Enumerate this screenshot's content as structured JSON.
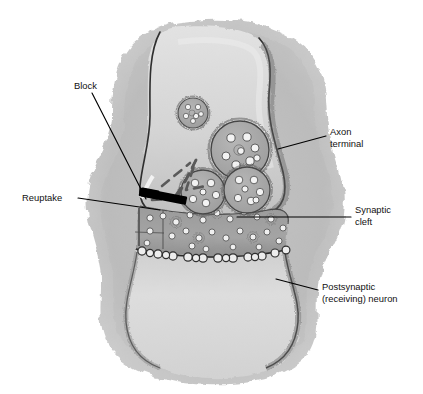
{
  "figure": {
    "type": "biological-illustration",
    "background_color": "#ffffff"
  },
  "colors": {
    "outer_cell_halo": "#b9b9b9",
    "cell_body_light": "#dedede",
    "axon_terminal_fill": "#cfcfcf",
    "synaptic_cleft_fill": "#9e9e9e",
    "postsynaptic_fill": "#d6d6d6",
    "vesicle_fill": "#a8a8a8",
    "vesicle_dot": "#f2f2f2",
    "membrane_outline": "#2b2b2b",
    "block_bar": "#000000",
    "dashed_path": "#5a5a5a",
    "leader_line": "#000000",
    "label_text": "#111111"
  },
  "labels": [
    {
      "id": "block",
      "lines": [
        "Block"
      ],
      "text_x": 74,
      "text_y": 89,
      "anchor": "start",
      "leader": {
        "x1": 92,
        "y1": 93,
        "x2": 146,
        "y2": 199
      }
    },
    {
      "id": "reuptake",
      "lines": [
        "Reuptake"
      ],
      "text_x": 22,
      "text_y": 201,
      "anchor": "start",
      "leader": {
        "x1": 78,
        "y1": 198,
        "x2": 160,
        "y2": 210
      }
    },
    {
      "id": "axon-terminal",
      "lines": [
        "Axon",
        "terminal"
      ],
      "text_x": 330,
      "text_y": 135,
      "anchor": "start",
      "leader": {
        "x1": 278,
        "y1": 149,
        "x2": 326,
        "y2": 136
      }
    },
    {
      "id": "synaptic-cleft",
      "lines": [
        "Synaptic",
        "cleft"
      ],
      "text_x": 355,
      "text_y": 213,
      "anchor": "start",
      "leader": {
        "x1": 237,
        "y1": 217,
        "x2": 351,
        "y2": 217
      }
    },
    {
      "id": "postsynaptic-neuron",
      "lines": [
        "Postsynaptic",
        "(receiving) neuron"
      ],
      "text_x": 322,
      "text_y": 290,
      "anchor": "start",
      "leader": {
        "x1": 276,
        "y1": 279,
        "x2": 318,
        "y2": 290
      }
    }
  ],
  "structures": {
    "axon_terminal": {
      "name": "Axon terminal",
      "description": "Bulb-shaped presynaptic ending containing vesicles"
    },
    "synaptic_cleft": {
      "name": "Synaptic cleft",
      "description": "Narrow dark gap between presynaptic and postsynaptic membranes filled with neurotransmitter"
    },
    "postsynaptic_neuron": {
      "name": "Postsynaptic (receiving) neuron",
      "description": "Lower cell with receptor bumps along its membrane"
    },
    "reuptake_path": {
      "name": "Reuptake",
      "description": "Dashed arrow showing neurotransmitter returning into the axon terminal"
    },
    "block": {
      "name": "Block",
      "description": "Solid black bar blocking the reuptake channel"
    }
  },
  "vesicles": [
    {
      "cx": 193,
      "cy": 113,
      "r": 15,
      "dots": 6
    },
    {
      "cx": 240,
      "cy": 150,
      "r": 29,
      "dots": 8
    },
    {
      "cx": 203,
      "cy": 192,
      "r": 22,
      "dots": 6
    },
    {
      "cx": 247,
      "cy": 190,
      "r": 23,
      "dots": 7
    }
  ],
  "cleft_transmitter_count": 26,
  "receptor_count": 16
}
